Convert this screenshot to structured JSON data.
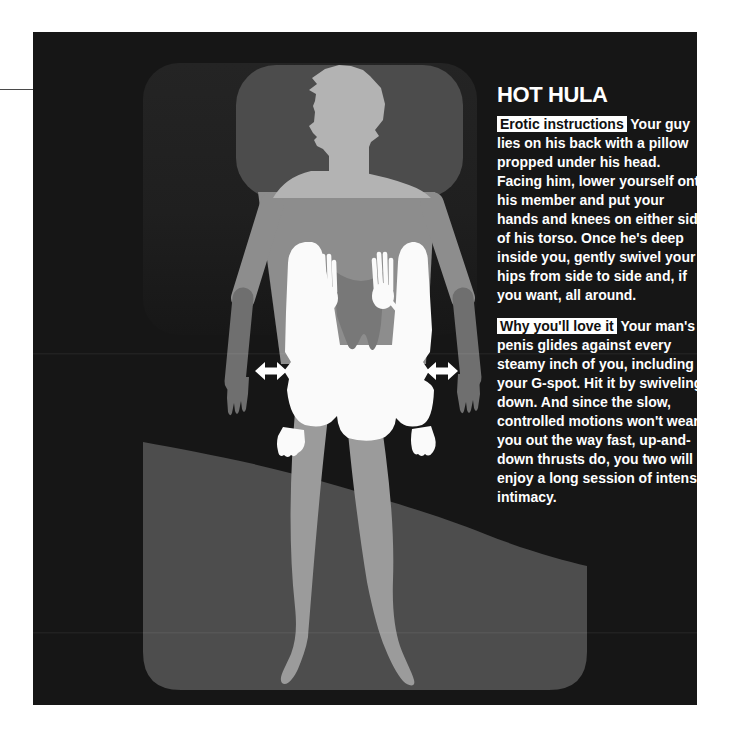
{
  "article": {
    "title": "HOT HULA",
    "sections": [
      {
        "label": "Erotic instructions",
        "text": " Your guy lies on his back with a pillow propped under his head. Facing him, lower yourself onto his member and put your hands and knees on either side of his torso. Once he's deep inside you, gently swivel your hips from side to side and, if you want, all around."
      },
      {
        "label": "Why you'll love it",
        "text": " Your man's penis glides against every steamy inch of you, including your G-spot. Hit it by swiveling down. And since the slow, controlled motions won't wear you out the way fast, up-and-down thrusts do, you two will enjoy a long session of intense intimacy."
      }
    ]
  },
  "illustration": {
    "description": "Overhead diagram of man lying on bed with pillow, woman kneeling astride facing him, double-headed arrows at her hips showing side-to-side swivel",
    "icons": [
      "left-right-arrow",
      "left-right-arrow"
    ],
    "colors": {
      "page_black": "#161616",
      "bed": "#232323",
      "blanket": "#4d4d4d",
      "pillow": "#4c4c4c",
      "man_light": "#b3b3b3",
      "man_mid": "#8d8d8d",
      "man_dark": "#6f6f6f",
      "man_leg": "#9b9b9b",
      "woman": "#fafafa",
      "hair": "#787878",
      "arrow": "#ffffff",
      "text": "#ffffff",
      "label_bg": "#ffffff",
      "label_text": "#111111"
    }
  }
}
